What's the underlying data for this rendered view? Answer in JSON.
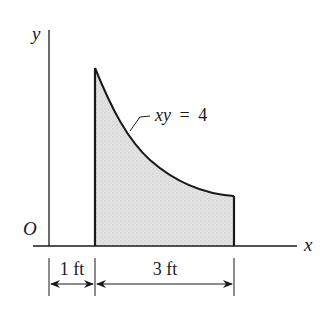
{
  "figure": {
    "type": "area-under-curve diagram",
    "axes": {
      "x_label": "x",
      "y_label": "y",
      "origin_label": "O"
    },
    "curve": {
      "equation_label": "xy = 4",
      "equation_parts": {
        "lhs": "xy",
        "eq": "=",
        "rhs": "4"
      },
      "x_start": 1,
      "x_end": 4
    },
    "dimensions": [
      {
        "label": "1 ft",
        "from": 0,
        "to": 1
      },
      {
        "label": "3 ft",
        "from": 1,
        "to": 4
      }
    ],
    "colors": {
      "line": "#1a1a1a",
      "shade": "#d9d9d9"
    }
  }
}
